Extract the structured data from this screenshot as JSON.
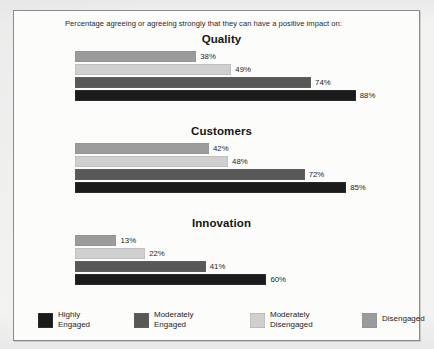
{
  "header": {
    "caption": "Percentage agreeing or agreeing strongly that they can have a positive impact on:"
  },
  "colors": {
    "highly_engaged": "#1b1b1b",
    "moderately_engaged": "#585858",
    "moderately_disengaged": "#cfcfcf",
    "disengaged": "#9b9b9b",
    "frame_border": "#8b8b8b",
    "text": "#1d1d1d"
  },
  "legend": {
    "items": [
      {
        "label_line1": "Highly",
        "label_line2": "Engaged",
        "color": "#1b1b1b",
        "name": "highly-engaged"
      },
      {
        "label_line1": "Moderately",
        "label_line2": "Engaged",
        "color": "#585858",
        "name": "moderately-engaged"
      },
      {
        "label_line1": "Moderately",
        "label_line2": "Disengaged",
        "color": "#cfcfcf",
        "name": "moderately-disengaged"
      },
      {
        "label_line1": "Disengaged",
        "label_line2": "",
        "color": "#9b9b9b",
        "name": "disengaged"
      }
    ]
  },
  "chart_data": {
    "type": "bar",
    "orientation": "horizontal",
    "title": "Percentage agreeing or agreeing strongly that they can have a positive impact on:",
    "xlabel": "",
    "ylabel": "",
    "xlim": [
      0,
      100
    ],
    "grid": false,
    "legend_position": "bottom",
    "value_suffix": "%",
    "categories": [
      "Quality",
      "Customers",
      "Innovation"
    ],
    "series": [
      {
        "name": "Highly Engaged",
        "color": "#1b1b1b",
        "values": [
          88,
          85,
          60
        ]
      },
      {
        "name": "Moderately Engaged",
        "color": "#585858",
        "values": [
          74,
          72,
          41
        ]
      },
      {
        "name": "Moderately Disengaged",
        "color": "#cfcfcf",
        "values": [
          49,
          48,
          22
        ]
      },
      {
        "name": "Disengaged",
        "color": "#9b9b9b",
        "values": [
          38,
          42,
          13
        ]
      }
    ],
    "panels": [
      {
        "title": "Quality",
        "bars": [
          {
            "series": "Disengaged",
            "value": 38,
            "label": "38%",
            "color": "#9b9b9b"
          },
          {
            "series": "Moderately Disengaged",
            "value": 49,
            "label": "49%",
            "color": "#cfcfcf"
          },
          {
            "series": "Moderately Engaged",
            "value": 74,
            "label": "74%",
            "color": "#585858"
          },
          {
            "series": "Highly Engaged",
            "value": 88,
            "label": "88%",
            "color": "#1b1b1b"
          }
        ]
      },
      {
        "title": "Customers",
        "bars": [
          {
            "series": "Disengaged",
            "value": 42,
            "label": "42%",
            "color": "#9b9b9b"
          },
          {
            "series": "Moderately Disengaged",
            "value": 48,
            "label": "48%",
            "color": "#cfcfcf"
          },
          {
            "series": "Moderately Engaged",
            "value": 72,
            "label": "72%",
            "color": "#585858"
          },
          {
            "series": "Highly Engaged",
            "value": 85,
            "label": "85%",
            "color": "#1b1b1b"
          }
        ]
      },
      {
        "title": "Innovation",
        "bars": [
          {
            "series": "Disengaged",
            "value": 13,
            "label": "13%",
            "color": "#9b9b9b"
          },
          {
            "series": "Moderately Disengaged",
            "value": 22,
            "label": "22%",
            "color": "#cfcfcf"
          },
          {
            "series": "Moderately Engaged",
            "value": 41,
            "label": "41%",
            "color": "#585858"
          },
          {
            "series": "Highly Engaged",
            "value": 60,
            "label": "60%",
            "color": "#1b1b1b"
          }
        ]
      }
    ]
  }
}
